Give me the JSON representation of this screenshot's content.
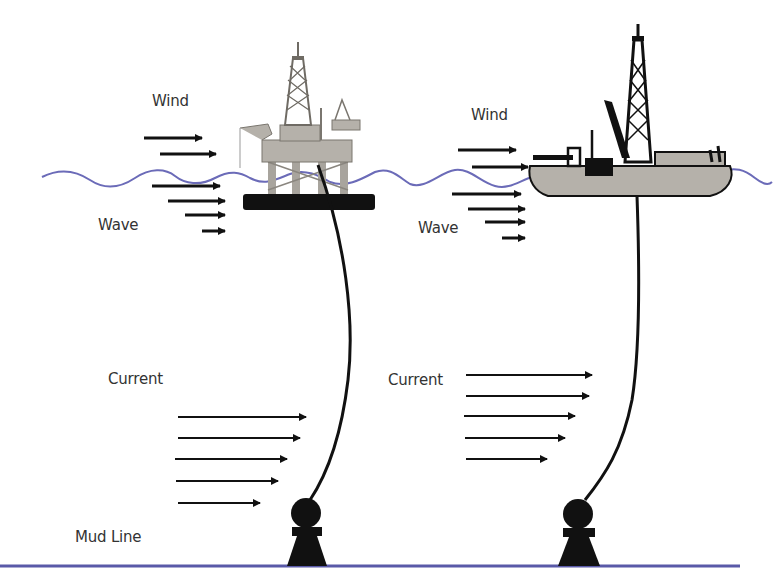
{
  "diagram": {
    "title": "",
    "colors": {
      "water_line": "#6b6bb8",
      "mud_line": "#5a5aa8",
      "structure_fill": "#b5b1aa",
      "structure_dark": "#111111",
      "arrow": "#111111",
      "text": "#333333"
    },
    "left_scene": {
      "structure": "semi-submersible platform",
      "labels": {
        "wind": "Wind",
        "wave": "Wave",
        "current": "Current",
        "mud_line": "Mud Line"
      }
    },
    "right_scene": {
      "structure": "drillship",
      "labels": {
        "wind": "Wind",
        "wave": "Wave",
        "current": "Current"
      }
    }
  }
}
